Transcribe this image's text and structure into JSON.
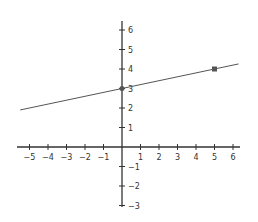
{
  "chart_data": {
    "type": "line",
    "title": "",
    "xlabel": "",
    "ylabel": "",
    "xlim": [
      -5.5,
      6.3
    ],
    "ylim": [
      -3,
      6.5
    ],
    "grid": false,
    "x_ticks": [
      -5,
      -4,
      -3,
      -2,
      -1,
      1,
      2,
      3,
      4,
      5,
      6
    ],
    "y_ticks": [
      6,
      5,
      4,
      3,
      2,
      1,
      -1,
      -2,
      -3
    ],
    "series": [
      {
        "name": "line",
        "equation": "y = 0.2x + 3",
        "slope": 0.2,
        "intercept": 3,
        "x_range": [
          -5.5,
          6.3
        ],
        "color": "#555555"
      }
    ],
    "points": [
      {
        "x": 0,
        "y": 3,
        "marker": "circle"
      },
      {
        "x": 5,
        "y": 4,
        "marker": "square"
      }
    ]
  },
  "colors": {
    "axis": "#333333",
    "line": "#555555",
    "point": "#555555",
    "label": "#333333"
  }
}
